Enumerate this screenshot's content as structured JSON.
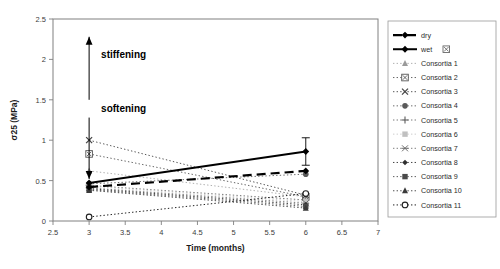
{
  "chart_data": {
    "type": "line",
    "title": "",
    "xlabel": "Time (months)",
    "ylabel": "σ25 (MPa)",
    "xlim": [
      2.5,
      7
    ],
    "ylim": [
      0,
      2.5
    ],
    "xticks": [
      "2.5",
      "3",
      "3.5",
      "4",
      "4.5",
      "5",
      "5.5",
      "6",
      "6.5",
      "7"
    ],
    "yticks": [
      "0",
      "0.5",
      "1",
      "1.5",
      "2",
      "2.5"
    ],
    "grid": false,
    "legend_position": "right-outside",
    "x": [
      3,
      6
    ],
    "series": [
      {
        "name": "dry",
        "values": [
          0.42,
          0.62
        ],
        "marker": "diamond-filled",
        "linestyle": "dashed",
        "color": "#000000",
        "width": 2.2
      },
      {
        "name": "wet",
        "values": [
          0.47,
          0.86
        ],
        "marker": "diamond-filled",
        "linestyle": "solid",
        "color": "#000000",
        "width": 2.0,
        "error": [
          0.0,
          0.17
        ]
      },
      {
        "name": "Consortia 1",
        "values": [
          0.62,
          0.3
        ],
        "marker": "triangle",
        "linestyle": "dotted",
        "color": "#9a9a9a",
        "width": 0.8
      },
      {
        "name": "Consortia 2",
        "values": [
          0.83,
          0.3
        ],
        "marker": "boxed-x",
        "linestyle": "dotted",
        "color": "#555555",
        "width": 0.9
      },
      {
        "name": "Consortia 3",
        "values": [
          1.0,
          0.32
        ],
        "marker": "x",
        "linestyle": "dotted",
        "color": "#444444",
        "width": 0.9
      },
      {
        "name": "Consortia 4",
        "values": [
          0.46,
          0.58
        ],
        "marker": "circle-filled",
        "linestyle": "dotted",
        "color": "#5a5a5a",
        "width": 0.9
      },
      {
        "name": "Consortia 5",
        "values": [
          0.44,
          0.26
        ],
        "marker": "plus",
        "linestyle": "dotted",
        "color": "#6a6a6a",
        "width": 0.9
      },
      {
        "name": "Consortia 6",
        "values": [
          0.43,
          0.24
        ],
        "marker": "square-faint",
        "linestyle": "dotted",
        "color": "#c0c0c0",
        "width": 0.8
      },
      {
        "name": "Consortia 7",
        "values": [
          0.41,
          0.22
        ],
        "marker": "asterisk",
        "linestyle": "dotted",
        "color": "#6f6f6f",
        "width": 0.9
      },
      {
        "name": "Consortia 8",
        "values": [
          0.4,
          0.2
        ],
        "marker": "diamond-small",
        "linestyle": "dotted",
        "color": "#2e2e2e",
        "width": 0.9
      },
      {
        "name": "Consortia 9",
        "values": [
          0.39,
          0.18
        ],
        "marker": "square-filled",
        "linestyle": "dotted",
        "color": "#4a4a4a",
        "width": 0.9
      },
      {
        "name": "Consortia 10",
        "values": [
          0.38,
          0.16
        ],
        "marker": "triangle-filled",
        "linestyle": "dotted",
        "color": "#3a3a3a",
        "width": 0.9
      },
      {
        "name": "Consortia 11",
        "values": [
          0.05,
          0.34
        ],
        "marker": "circle-open",
        "linestyle": "dotted",
        "color": "#202020",
        "width": 1.0
      }
    ],
    "annotations": [
      {
        "text": "stiffening",
        "direction": "up",
        "x": 3.0,
        "y_from": 1.5,
        "y_to": 2.28
      },
      {
        "text": "softening",
        "direction": "down",
        "x": 3.0,
        "y_from": 1.28,
        "y_to": 0.52
      }
    ]
  }
}
